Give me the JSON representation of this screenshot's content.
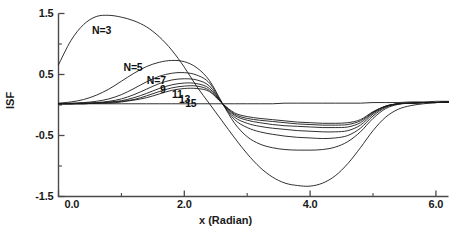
{
  "chart_data": {
    "type": "line",
    "title": "",
    "xlabel": "x (Radian)",
    "ylabel": "ISF",
    "xlim": [
      0.0,
      6.2
    ],
    "ylim": [
      -1.5,
      1.5
    ],
    "grid": false,
    "legend_position": "inline-curve-labels",
    "x_ticks_major": [
      "0.0",
      "2.0",
      "4.0",
      "6.0"
    ],
    "x_tick_values": [
      0.0,
      2.0,
      4.0,
      6.0
    ],
    "x_minor_tick_values": [
      1.0,
      3.0,
      5.0
    ],
    "y_ticks_major": [
      "1.5",
      "0.5",
      "-0.5",
      "-1.5"
    ],
    "y_tick_values": [
      1.5,
      0.5,
      -0.5,
      -1.5
    ],
    "y_minor_tick_values": [
      1.0,
      0.0,
      -1.0
    ],
    "annotations": [
      "N=3",
      "N=5",
      "N=7",
      "9",
      "11",
      "13",
      "15"
    ],
    "x": [
      0.0,
      0.2,
      0.4,
      0.6,
      0.8,
      1.0,
      1.2,
      1.4,
      1.6,
      1.8,
      2.0,
      2.2,
      2.4,
      2.6,
      2.8,
      3.0,
      3.2,
      3.4,
      3.6,
      3.8,
      4.0,
      4.2,
      4.4,
      4.6,
      4.8,
      5.0,
      5.2,
      5.4,
      5.6,
      5.8,
      6.0,
      6.2
    ],
    "series": [
      {
        "name": "N=3",
        "label": "N=3",
        "label_x": 0.55,
        "label_y": 1.22,
        "values": [
          0.66,
          1.06,
          1.32,
          1.45,
          1.47,
          1.44,
          1.38,
          1.28,
          1.12,
          0.9,
          0.62,
          0.3,
          0.02,
          -0.26,
          -0.54,
          -0.8,
          -1.02,
          -1.18,
          -1.28,
          -1.32,
          -1.33,
          -1.28,
          -1.16,
          -0.96,
          -0.7,
          -0.42,
          -0.2,
          -0.07,
          -0.01,
          0.02,
          0.04,
          0.05
        ]
      },
      {
        "name": "N=5",
        "label": "N=5",
        "label_x": 1.05,
        "label_y": 0.6,
        "values": [
          0.03,
          0.05,
          0.09,
          0.16,
          0.26,
          0.39,
          0.52,
          0.63,
          0.7,
          0.73,
          0.71,
          0.61,
          0.4,
          0.04,
          -0.3,
          -0.52,
          -0.64,
          -0.7,
          -0.73,
          -0.74,
          -0.74,
          -0.73,
          -0.69,
          -0.6,
          -0.44,
          -0.22,
          -0.06,
          0.01,
          0.03,
          0.04,
          0.04,
          0.05
        ]
      },
      {
        "name": "N=7",
        "label": "N=7",
        "label_x": 1.42,
        "label_y": 0.4,
        "values": [
          0.02,
          0.03,
          0.04,
          0.06,
          0.1,
          0.17,
          0.27,
          0.38,
          0.47,
          0.52,
          0.53,
          0.49,
          0.36,
          0.03,
          -0.24,
          -0.37,
          -0.44,
          -0.48,
          -0.51,
          -0.53,
          -0.54,
          -0.55,
          -0.54,
          -0.5,
          -0.38,
          -0.18,
          -0.04,
          0.02,
          0.03,
          0.04,
          0.04,
          0.05
        ]
      },
      {
        "name": "N=9",
        "label": "9",
        "label_x": 1.63,
        "label_y": 0.24,
        "values": [
          0.02,
          0.02,
          0.03,
          0.04,
          0.06,
          0.1,
          0.17,
          0.26,
          0.35,
          0.41,
          0.43,
          0.41,
          0.31,
          0.03,
          -0.2,
          -0.3,
          -0.35,
          -0.38,
          -0.4,
          -0.42,
          -0.43,
          -0.44,
          -0.44,
          -0.42,
          -0.33,
          -0.15,
          -0.03,
          0.02,
          0.03,
          0.04,
          0.04,
          0.05
        ]
      },
      {
        "name": "N=11",
        "label": "11",
        "label_x": 1.82,
        "label_y": 0.16,
        "values": [
          0.02,
          0.02,
          0.03,
          0.03,
          0.05,
          0.07,
          0.12,
          0.19,
          0.27,
          0.33,
          0.36,
          0.35,
          0.27,
          0.03,
          -0.17,
          -0.25,
          -0.29,
          -0.32,
          -0.34,
          -0.35,
          -0.36,
          -0.37,
          -0.37,
          -0.36,
          -0.29,
          -0.13,
          -0.02,
          0.02,
          0.03,
          0.04,
          0.04,
          0.05
        ]
      },
      {
        "name": "N=13",
        "label": "13",
        "label_x": 1.93,
        "label_y": 0.09,
        "values": [
          0.02,
          0.02,
          0.02,
          0.03,
          0.04,
          0.06,
          0.09,
          0.15,
          0.22,
          0.28,
          0.31,
          0.31,
          0.24,
          0.03,
          -0.15,
          -0.22,
          -0.25,
          -0.27,
          -0.29,
          -0.31,
          -0.32,
          -0.33,
          -0.33,
          -0.32,
          -0.26,
          -0.12,
          -0.02,
          0.02,
          0.03,
          0.04,
          0.04,
          0.05
        ]
      },
      {
        "name": "N=15",
        "label": "15",
        "label_x": 2.03,
        "label_y": 0.02,
        "values": [
          0.02,
          0.02,
          0.02,
          0.03,
          0.03,
          0.05,
          0.08,
          0.12,
          0.18,
          0.24,
          0.27,
          0.27,
          0.22,
          0.03,
          -0.13,
          -0.19,
          -0.22,
          -0.24,
          -0.26,
          -0.28,
          -0.29,
          -0.3,
          -0.3,
          -0.29,
          -0.24,
          -0.11,
          -0.02,
          0.02,
          0.03,
          0.04,
          0.04,
          0.05
        ]
      },
      {
        "name": "baseline",
        "label": "",
        "label_x": null,
        "label_y": null,
        "values": [
          0.02,
          0.02,
          0.02,
          0.02,
          0.02,
          0.02,
          0.02,
          0.02,
          0.02,
          0.02,
          0.02,
          0.02,
          0.02,
          0.02,
          0.02,
          0.02,
          0.02,
          0.02,
          0.03,
          0.03,
          0.03,
          0.03,
          0.03,
          0.03,
          0.03,
          0.04,
          0.04,
          0.04,
          0.05,
          0.05,
          0.06,
          0.06
        ]
      }
    ]
  },
  "colors": {
    "curve": "#1a1a1a",
    "axis": "#4a4a4a",
    "text": "#1a1a1a",
    "background": "#ffffff"
  }
}
